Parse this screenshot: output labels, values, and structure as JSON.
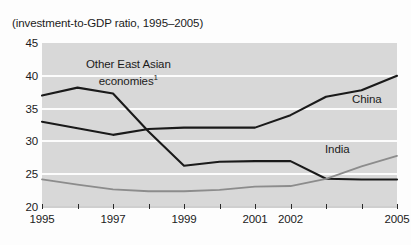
{
  "caption": "(investment-to-GDP ratio, 1995–2005)",
  "axes": {
    "y_ticks": [
      45,
      40,
      35,
      30,
      25,
      20
    ],
    "y_min": 20,
    "y_max": 45,
    "x_years": [
      1995,
      1996,
      1997,
      1998,
      1999,
      2000,
      2001,
      2002,
      2003,
      2004,
      2005
    ],
    "x_tick_labels": [
      "1995",
      "1997",
      "1999",
      "2001",
      "2002",
      "2005"
    ],
    "x_label_years": [
      1995,
      1997,
      1999,
      2001,
      2002,
      2005
    ]
  },
  "annotations": {
    "other_line1": "Other East Asian",
    "other_line2": "economies",
    "other_footnote": "1",
    "china": "China",
    "india": "India"
  },
  "colors": {
    "panel": "#d8d8d8",
    "gridline": "#fcfcfc",
    "dark_series": "#1a1a1a",
    "gray_series": "#8c8c8c",
    "text": "#1b1b1b"
  },
  "chart_data": {
    "type": "line",
    "title": "",
    "subtitle": "(investment-to-GDP ratio, 1995–2005)",
    "xlabel": "",
    "ylabel": "",
    "ylim": [
      20,
      45
    ],
    "yticks": [
      20,
      25,
      30,
      35,
      40,
      45
    ],
    "grid": true,
    "legend": "inline-annotations",
    "x": [
      1995,
      1996,
      1997,
      1998,
      1999,
      2000,
      2001,
      2002,
      2003,
      2004,
      2005
    ],
    "series": [
      {
        "name": "Other East Asian economies",
        "color": "#1a1a1a",
        "values": [
          37.0,
          38.2,
          37.3,
          31.5,
          26.3,
          26.9,
          27.0,
          27.0,
          24.3,
          24.2,
          24.2
        ]
      },
      {
        "name": "China",
        "color": "#1a1a1a",
        "values": [
          33.0,
          32.0,
          31.0,
          31.9,
          32.1,
          32.1,
          32.1,
          34.0,
          36.8,
          37.8,
          40.0
        ]
      },
      {
        "name": "India",
        "color": "#8c8c8c",
        "values": [
          24.2,
          23.4,
          22.7,
          22.4,
          22.4,
          22.6,
          23.1,
          23.2,
          24.3,
          26.2,
          27.8
        ]
      }
    ]
  }
}
